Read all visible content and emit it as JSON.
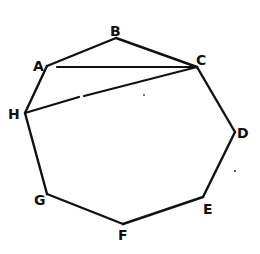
{
  "diagram": {
    "type": "octagon",
    "vertices": [
      {
        "name": "A",
        "x": 47,
        "y": 66,
        "label": "A",
        "lx": 33,
        "ly": 71
      },
      {
        "name": "B",
        "x": 116,
        "y": 38,
        "label": "B",
        "lx": 110,
        "ly": 36
      },
      {
        "name": "C",
        "x": 197,
        "y": 67,
        "label": "C",
        "lx": 196,
        "ly": 65
      },
      {
        "name": "D",
        "x": 235,
        "y": 132,
        "label": "D",
        "lx": 237,
        "ly": 138
      },
      {
        "name": "E",
        "x": 203,
        "y": 197,
        "label": "E",
        "lx": 203,
        "ly": 214
      },
      {
        "name": "F",
        "x": 123,
        "y": 224,
        "label": "F",
        "lx": 118,
        "ly": 240
      },
      {
        "name": "G",
        "x": 47,
        "y": 194,
        "label": "G",
        "lx": 34,
        "ly": 205
      },
      {
        "name": "H",
        "x": 25,
        "y": 113,
        "label": "H",
        "lx": 8,
        "ly": 119
      }
    ],
    "edges": [
      [
        "A",
        "B"
      ],
      [
        "B",
        "C"
      ],
      [
        "C",
        "D"
      ],
      [
        "D",
        "E"
      ],
      [
        "E",
        "F"
      ],
      [
        "F",
        "G"
      ],
      [
        "G",
        "H"
      ],
      [
        "H",
        "A"
      ]
    ],
    "diagonals": [
      {
        "from": "A",
        "to": "C",
        "style": "solid"
      },
      {
        "from": "H",
        "to": "C",
        "style": "broken"
      }
    ],
    "labels": {
      "A": "A",
      "B": "B",
      "C": "C",
      "D": "D",
      "E": "E",
      "F": "F",
      "G": "G",
      "H": "H"
    }
  }
}
